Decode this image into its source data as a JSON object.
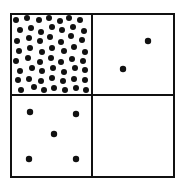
{
  "diagram": {
    "type": "2x2 grid of squares with dot patterns",
    "frame": {
      "x": 11,
      "y": 14,
      "width": 163,
      "height": 163,
      "stroke": "#111111"
    },
    "dividers": {
      "vertical_x": 92,
      "horizontal_y": 95
    },
    "dot_color": "#111111",
    "quadrants": [
      {
        "id": "top-left",
        "description": "densely packed dots",
        "dots": [
          [
            16,
            20
          ],
          [
            27,
            18
          ],
          [
            39,
            20
          ],
          [
            49,
            18
          ],
          [
            60,
            21
          ],
          [
            69,
            18
          ],
          [
            80,
            20
          ],
          [
            20,
            30
          ],
          [
            31,
            28
          ],
          [
            41,
            32
          ],
          [
            52,
            27
          ],
          [
            62,
            30
          ],
          [
            73,
            27
          ],
          [
            84,
            31
          ],
          [
            17,
            41
          ],
          [
            29,
            38
          ],
          [
            40,
            41
          ],
          [
            50,
            37
          ],
          [
            61,
            42
          ],
          [
            71,
            36
          ],
          [
            82,
            40
          ],
          [
            19,
            51
          ],
          [
            30,
            48
          ],
          [
            42,
            52
          ],
          [
            52,
            48
          ],
          [
            64,
            51
          ],
          [
            74,
            47
          ],
          [
            85,
            52
          ],
          [
            16,
            61
          ],
          [
            28,
            58
          ],
          [
            40,
            62
          ],
          [
            51,
            58
          ],
          [
            61,
            62
          ],
          [
            72,
            59
          ],
          [
            83,
            61
          ],
          [
            20,
            71
          ],
          [
            32,
            68
          ],
          [
            42,
            71
          ],
          [
            53,
            68
          ],
          [
            64,
            72
          ],
          [
            75,
            68
          ],
          [
            85,
            70
          ],
          [
            18,
            80
          ],
          [
            29,
            79
          ],
          [
            41,
            81
          ],
          [
            52,
            78
          ],
          [
            63,
            81
          ],
          [
            74,
            79
          ],
          [
            85,
            80
          ],
          [
            21,
            90
          ],
          [
            34,
            87
          ],
          [
            44,
            90
          ],
          [
            54,
            88
          ],
          [
            65,
            90
          ],
          [
            76,
            88
          ],
          [
            86,
            90
          ]
        ]
      },
      {
        "id": "top-right",
        "description": "two dots",
        "dots": [
          [
            148,
            41
          ],
          [
            123,
            69
          ]
        ]
      },
      {
        "id": "bottom-left",
        "description": "five dots in dice pattern",
        "dots": [
          [
            30,
            112
          ],
          [
            76,
            114
          ],
          [
            54,
            134
          ],
          [
            29,
            159
          ],
          [
            76,
            159
          ]
        ]
      },
      {
        "id": "bottom-right",
        "description": "empty",
        "dots": []
      }
    ]
  }
}
